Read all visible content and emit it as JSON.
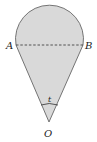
{
  "diagram": {
    "labels": {
      "point_a": "A",
      "point_b": "B",
      "point_o": "O",
      "angle": "t"
    },
    "colors": {
      "fill": "#d9d9d9",
      "stroke": "#555555",
      "background": "#ffffff"
    },
    "shape": "circular segment atop isosceles triangle with apex O, dashed chord AB, angle t at O"
  }
}
